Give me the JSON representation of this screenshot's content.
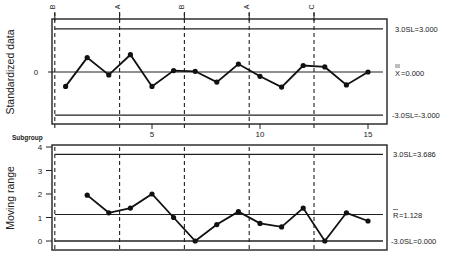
{
  "chart_data": [
    {
      "type": "line",
      "title": "",
      "ylabel": "Standardized data",
      "xlabel": "Subgroup",
      "x": [
        1,
        2,
        3,
        4,
        5,
        6,
        7,
        8,
        9,
        10,
        11,
        12,
        13,
        14,
        15
      ],
      "series": [
        {
          "name": "Standardized data",
          "values": [
            -1.0,
            1.0,
            -0.2,
            1.2,
            -1.0,
            0.1,
            0.05,
            -0.7,
            0.55,
            -0.3,
            -1.05,
            0.45,
            0.35,
            -0.9,
            0.0
          ]
        }
      ],
      "yticks": [
        "0"
      ],
      "ylim": [
        -3.6,
        3.8
      ],
      "reference_lines": [
        {
          "label": "3.0SL=3.000",
          "value": 3.0
        },
        {
          "label": "X̿=0.000",
          "value": 0.0
        },
        {
          "label": "-3.0SL=-3.000",
          "value": -3.0
        }
      ],
      "stage_labels": [
        {
          "label": "B",
          "x": 0.5
        },
        {
          "label": "A",
          "x": 3.5
        },
        {
          "label": "B",
          "x": 6.5
        },
        {
          "label": "A",
          "x": 9.5
        },
        {
          "label": "C",
          "x": 12.5
        }
      ],
      "grid": false
    },
    {
      "type": "line",
      "title": "",
      "ylabel": "Moving range",
      "xlabel": "Subgroup",
      "x": [
        2,
        3,
        4,
        5,
        6,
        7,
        8,
        9,
        10,
        11,
        12,
        13,
        14,
        15
      ],
      "series": [
        {
          "name": "Moving range",
          "values": [
            1.95,
            1.2,
            1.4,
            2.0,
            1.0,
            0.0,
            0.7,
            1.25,
            0.75,
            0.6,
            1.4,
            0.0,
            1.2,
            0.85
          ]
        }
      ],
      "xticks": [
        "5",
        "10",
        "15"
      ],
      "yticks": [
        "0",
        "1",
        "2",
        "3",
        "4"
      ],
      "ylim": [
        -0.3,
        4.0
      ],
      "reference_lines": [
        {
          "label": "3.0SL=3.686",
          "value": 3.686
        },
        {
          "label": "R̄=1.128",
          "value": 1.128
        },
        {
          "label": "-3.0SL=0.000",
          "value": 0.0
        }
      ],
      "grid": false
    }
  ],
  "labels": {
    "top_ylabel": "Standardized data",
    "bottom_ylabel": "Moving range",
    "subgroup": "Subgroup",
    "top_zero": "0",
    "top_ucl": "3.0SL=3.000",
    "top_center": "=0.000",
    "top_center_symbol": "X",
    "top_lcl": "-3.0SL=-3.000",
    "bottom_ucl": "3.0SL=3.686",
    "bottom_center": "=1.128",
    "bottom_center_symbol": "R",
    "bottom_lcl": "-3.0SL=0.000",
    "stage": [
      "B",
      "A",
      "B",
      "A",
      "C"
    ],
    "xticks": [
      "5",
      "10",
      "15"
    ],
    "yticks_bottom": [
      "4",
      "3",
      "2",
      "1",
      "0"
    ]
  }
}
